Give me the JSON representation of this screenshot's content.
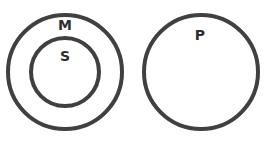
{
  "diagram": {
    "type": "euler",
    "stroke_color": "#404040",
    "background": "#ffffff",
    "circles": [
      {
        "id": "M",
        "label": "M",
        "cx": 65,
        "cy": 72,
        "r": 57
      },
      {
        "id": "S",
        "label": "S",
        "cx": 65,
        "cy": 72,
        "r": 34
      },
      {
        "id": "P",
        "label": "P",
        "cx": 201,
        "cy": 72,
        "r": 57
      }
    ],
    "relations": [
      "S inside M",
      "P disjoint from M"
    ]
  }
}
